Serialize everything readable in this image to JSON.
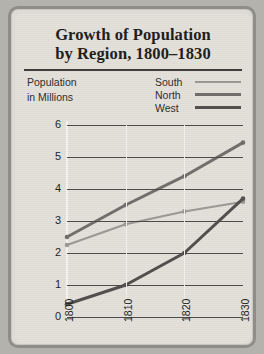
{
  "card": {
    "title_line1": "Growth of Population",
    "title_line2": "by Region, 1800–1830"
  },
  "axis_caption": {
    "line1": "Population",
    "line2": "in Millions"
  },
  "legend": {
    "position": "top-right",
    "entries": [
      {
        "label": "South",
        "color": "#9a9893",
        "width": 2
      },
      {
        "label": "North",
        "color": "#6f6d69",
        "width": 3
      },
      {
        "label": "West",
        "color": "#4f4d4a",
        "width": 3
      }
    ]
  },
  "chart_data": {
    "type": "line",
    "title": "Growth of Population by Region, 1800–1830",
    "xlabel": "",
    "ylabel": "Population in Millions",
    "x": [
      1800,
      1810,
      1820,
      1830
    ],
    "xticklabels": [
      "1800",
      "1810",
      "1820",
      "1830"
    ],
    "yticklabels": [
      "0",
      "1",
      "2",
      "3",
      "4",
      "5",
      "6"
    ],
    "ylim": [
      0,
      6
    ],
    "ytick_step": 1,
    "grid": "horizontal",
    "legend_position": "top-right",
    "series": [
      {
        "name": "South",
        "color": "#9a9893",
        "values": [
          2.25,
          2.9,
          3.3,
          3.6
        ]
      },
      {
        "name": "North",
        "color": "#6f6d69",
        "values": [
          2.5,
          3.5,
          4.4,
          5.45
        ]
      },
      {
        "name": "West",
        "color": "#4f4d4a",
        "values": [
          0.4,
          1.0,
          2.0,
          3.7
        ]
      }
    ]
  }
}
